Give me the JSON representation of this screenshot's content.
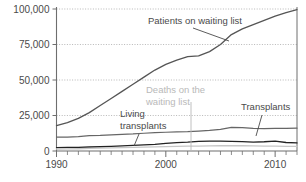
{
  "chart_data": {
    "type": "line",
    "title": "",
    "subtitle": "",
    "xlabel": "",
    "ylabel": "",
    "xlim": [
      1990,
      2012
    ],
    "ylim": [
      0,
      100000
    ],
    "grid": true,
    "grid_axis": "y",
    "legend": "annotations-inline",
    "yticks": [
      0,
      25000,
      50000,
      75000,
      100000
    ],
    "yticklabels": [
      "0",
      "25,000",
      "50,000",
      "75,000",
      "100,000"
    ],
    "xticks": [
      1990,
      2000,
      2010
    ],
    "xticklabels": [
      "1990",
      "2000",
      "2010"
    ],
    "x": [
      1990,
      1991,
      1992,
      1993,
      1994,
      1995,
      1996,
      1997,
      1998,
      1999,
      2000,
      2001,
      2002,
      2003,
      2004,
      2005,
      2006,
      2007,
      2008,
      2009,
      2010,
      2011,
      2012
    ],
    "series": [
      {
        "name": "Patients on waiting list",
        "color": "#555555",
        "width": 1.3,
        "values": [
          17900,
          20000,
          23000,
          27000,
          32000,
          37000,
          42000,
          47000,
          52000,
          57000,
          61000,
          64000,
          66500,
          67000,
          70000,
          75000,
          82000,
          86000,
          89000,
          92000,
          95000,
          97500,
          99500
        ]
      },
      {
        "name": "Transplants",
        "color": "#666666",
        "width": 1.2,
        "values": [
          9800,
          9800,
          10100,
          10800,
          11000,
          11400,
          11700,
          12000,
          12500,
          12900,
          13200,
          13500,
          13600,
          14000,
          14500,
          15200,
          16600,
          16500,
          16000,
          15800,
          15900,
          16000,
          16100
        ]
      },
      {
        "name": "Living transplants",
        "color": "#222222",
        "width": 1.3,
        "values": [
          2400,
          2500,
          2600,
          2800,
          3000,
          3300,
          3600,
          3900,
          4300,
          4700,
          5300,
          5900,
          6200,
          6800,
          7000,
          6900,
          6800,
          6600,
          6300,
          6500,
          6900,
          6000,
          5700
        ]
      },
      {
        "name": "Deaths on the waiting list",
        "color": "#c6c6c6",
        "width": 1.3,
        "values": [
          1400,
          1500,
          1600,
          1800,
          2000,
          2200,
          2400,
          2500,
          2700,
          2900,
          3100,
          3300,
          3400,
          3500,
          3600,
          3700,
          3700,
          3700,
          3600,
          3500,
          3400,
          3300,
          3200
        ]
      }
    ],
    "annotations": [
      {
        "id": "patients-on-waiting-list",
        "text_line1": "Patients on waiting list",
        "text_line2": "",
        "color": "#4a4a4a",
        "text_x": 148,
        "text_y": 24,
        "anchor": "start",
        "leader": [
          [
            193,
            28
          ],
          [
            229,
            41
          ]
        ]
      },
      {
        "id": "deaths-on-the-waiting-list",
        "text_line1": "Deaths on the",
        "text_line2": "waiting list",
        "color": "#b9b9b9",
        "text_x": 146,
        "text_y": 93,
        "anchor": "start",
        "leader": [
          [
            191,
            102
          ],
          [
            191,
            151
          ]
        ]
      },
      {
        "id": "living-transplants",
        "text_line1": "Living",
        "text_line2": "transplants",
        "color": "#4a4a4a",
        "text_x": 120,
        "text_y": 117,
        "anchor": "start",
        "leader": [
          [
            139,
            134
          ],
          [
            134,
            146
          ]
        ]
      },
      {
        "id": "transplants",
        "text_line1": "Transplants",
        "text_line2": "",
        "color": "#4a4a4a",
        "text_x": 241,
        "text_y": 110,
        "anchor": "start",
        "leader": [
          [
            262,
            115
          ],
          [
            256,
            136
          ]
        ]
      }
    ],
    "colors": {
      "axis": "#6e6e6e",
      "grid": "#9a9a9a",
      "text": "#4a4a4a",
      "text_light": "#b9b9b9",
      "background": "#ffffff"
    }
  }
}
